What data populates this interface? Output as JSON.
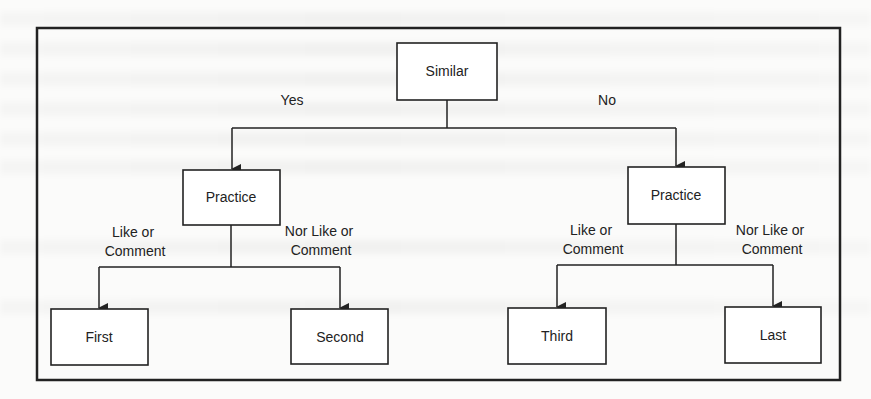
{
  "diagram": {
    "type": "decision-tree",
    "root": {
      "label": "Similar"
    },
    "level1": {
      "yes_label": "Yes",
      "no_label": "No",
      "left": {
        "label": "Practice"
      },
      "right": {
        "label": "Practice"
      }
    },
    "level2": {
      "left_like_line1": "Like or",
      "left_like_line2": "Comment",
      "left_nor_line1": "Nor Like or",
      "left_nor_line2": "Comment",
      "right_like_line1": "Like or",
      "right_like_line2": "Comment",
      "right_nor_line1": "Nor Like or",
      "right_nor_line2": "Comment"
    },
    "leaves": [
      {
        "label": "First"
      },
      {
        "label": "Second"
      },
      {
        "label": "Third"
      },
      {
        "label": "Last"
      }
    ],
    "colors": {
      "stroke": "#222222",
      "background": "#fbfbfa",
      "text": "#222222"
    }
  }
}
